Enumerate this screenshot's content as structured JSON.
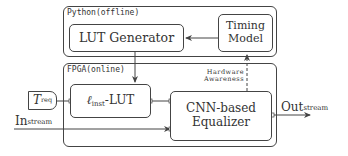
{
  "python_container": {
    "label": "Python(offline)"
  },
  "fpga_container": {
    "label": "FPGA(online)"
  },
  "blocks": {
    "lut_generator": "LUT Generator",
    "timing_model": {
      "line1": "Timing",
      "line2": "Model"
    },
    "inst_lut": {
      "prefix": "ℓ",
      "sub": "inst",
      "suffix": "-LUT"
    },
    "cnn_equalizer": {
      "line1": "CNN-based",
      "line2": "Equalizer"
    },
    "t_req": {
      "main": "T",
      "sub": "req"
    }
  },
  "annotations": {
    "hardware_awareness": {
      "line1": "Hardware",
      "line2": "Awareness"
    }
  },
  "io": {
    "input": {
      "main": "In",
      "sub": "stream"
    },
    "output": {
      "main": "Out",
      "sub": "stream"
    }
  },
  "colors": {
    "stroke": "#444444",
    "text": "#333333",
    "background": "#ffffff"
  }
}
